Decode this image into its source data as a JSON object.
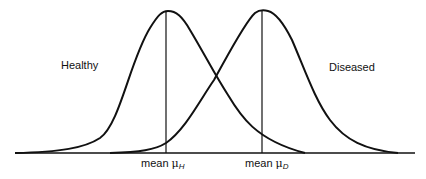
{
  "diagram": {
    "labels": {
      "healthy": "Healthy",
      "diseased": "Diseased",
      "mean_healthy_prefix": "mean",
      "mean_healthy_symbol": "μ",
      "mean_healthy_subscript": "H",
      "mean_diseased_prefix": "mean",
      "mean_diseased_symbol": "μ",
      "mean_diseased_subscript": "D"
    },
    "curves": [
      {
        "name": "Healthy",
        "mean_x": 166,
        "peak_y": 11
      },
      {
        "name": "Diseased",
        "mean_x": 262,
        "peak_y": 11
      }
    ],
    "baseline_y": 153,
    "line_color": "#111111"
  }
}
